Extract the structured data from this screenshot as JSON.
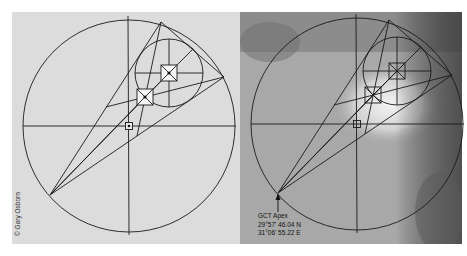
{
  "figure": {
    "left_panel": {
      "name": "geometric construction diagram",
      "background": "#dcdcdc",
      "credit": "© Gary Osborn"
    },
    "right_panel": {
      "name": "aerial photo overlay",
      "background": "#9a9a9a",
      "apex_label": {
        "title": "GCT Apex",
        "lat": "29°57' 46.04 N",
        "lon": "31°06' 55.22 E"
      }
    },
    "line_color": "#1a1a1a",
    "footer_faint": "· · · ·"
  }
}
